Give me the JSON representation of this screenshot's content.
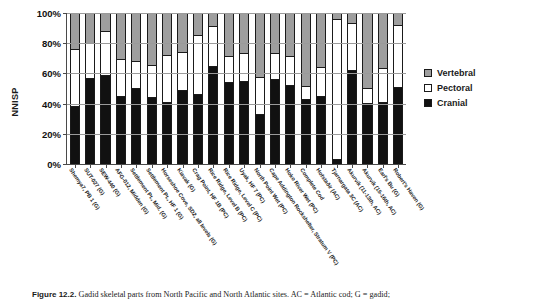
{
  "figure": {
    "ylabel": "NNISP",
    "caption_bold": "Figure 12.2.",
    "caption_rest": " Gadid skeletal parts from North Pacific and North Atlantic sites. AC = Atlantic cod; G = gadid;"
  },
  "legend": {
    "position": "right",
    "items": [
      {
        "label": "Vertebral",
        "color": "#9e9e9e",
        "swatch": "vert"
      },
      {
        "label": "Pectoral",
        "color": "#ffffff",
        "swatch": "pect"
      },
      {
        "label": "Cranial",
        "color": "#111111",
        "swatch": "cran"
      }
    ]
  },
  "chart_data": {
    "type": "bar",
    "subtype": "stacked-percent",
    "title": "",
    "xlabel": "",
    "ylabel": "NNISP",
    "ylim": [
      0,
      100
    ],
    "yticks": [
      "0%",
      "20%",
      "40%",
      "60%",
      "80%",
      "100%"
    ],
    "ytick_values": [
      0,
      20,
      40,
      60,
      80,
      100
    ],
    "grid": true,
    "legend_position": "right",
    "categories": [
      "Shemya7, PB 1 (G)",
      "SUT-027 (G)",
      "SEW-440 (G)",
      "AFG-012, Midden (G)",
      "Settlement Pt., Mid. (G)",
      "Settlement Pt., HF 1 (G)",
      "Horseshoe Cove, SD2, all levels (G)",
      "Kiavak (G)",
      "Crag Point, HF 1B (PC)",
      "Rice Ridge, Level B (PC)",
      "Rice Ridge, Level C (PC)",
      "Uyak, HF 7 (PC)",
      "North Point Wet (PC)",
      "Cape Addington Rockshelter, Stratum V (PC)",
      "Hoko River Wet (PC)",
      "Complete Cod",
      "Hofstaðir (AC)",
      "Tjarnargata 3C (AC)",
      "Akurvik (11-13th, AC)",
      "Akurvik (15-16th, AC)",
      "Earl's Bu (G)",
      "Robert's Haven (G)"
    ],
    "series": [
      {
        "name": "Cranial",
        "color": "#111111",
        "values": [
          38,
          57,
          59,
          45,
          50,
          44,
          41,
          49,
          46,
          65,
          54,
          55,
          33,
          56,
          52,
          43,
          45,
          3,
          62,
          40,
          41,
          51
        ]
      },
      {
        "name": "Pectoral",
        "color": "#ffffff",
        "values": [
          39,
          24,
          30,
          25,
          19,
          22,
          32,
          26,
          40,
          27,
          18,
          19,
          25,
          18,
          20,
          9,
          20,
          94,
          32,
          11,
          23,
          42
        ]
      },
      {
        "name": "Vertebral",
        "color": "#9e9e9e",
        "values": [
          23,
          19,
          11,
          30,
          31,
          34,
          27,
          25,
          14,
          8,
          28,
          26,
          42,
          26,
          28,
          48,
          35,
          3,
          6,
          49,
          36,
          7
        ]
      }
    ]
  }
}
